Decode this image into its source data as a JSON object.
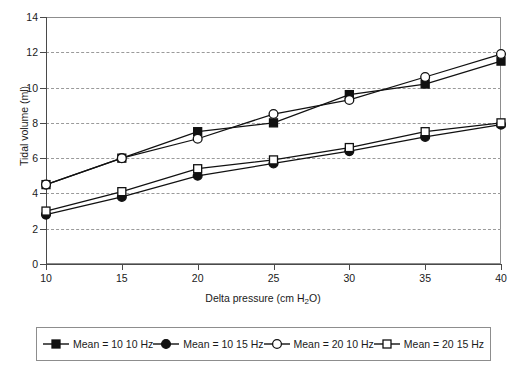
{
  "chart_data": {
    "type": "line",
    "title": "",
    "xlabel": "Delta pressure (cm H2O)",
    "ylabel": "Tidal volume (ml)",
    "x": [
      10,
      15,
      20,
      25,
      30,
      35,
      40
    ],
    "xlim": [
      10,
      40
    ],
    "ylim": [
      0,
      14
    ],
    "xticks": [
      10,
      15,
      20,
      25,
      30,
      35,
      40
    ],
    "yticks": [
      0,
      2,
      4,
      6,
      8,
      10,
      12,
      14
    ],
    "grid": "horizontal-dashed",
    "legend_position": "bottom",
    "series": [
      {
        "name": "Mean = 10 10 Hz",
        "marker": "filled-square",
        "values": [
          4.5,
          6.0,
          7.5,
          8.0,
          9.6,
          10.2,
          11.5
        ]
      },
      {
        "name": "Mean = 10 15 Hz",
        "marker": "filled-circle",
        "values": [
          2.8,
          3.8,
          5.0,
          5.7,
          6.4,
          7.2,
          7.9
        ]
      },
      {
        "name": "Mean = 20 10 Hz",
        "marker": "open-circle",
        "values": [
          4.5,
          6.0,
          7.1,
          8.5,
          9.3,
          10.6,
          11.9
        ]
      },
      {
        "name": "Mean = 20 15 Hz",
        "marker": "open-square",
        "values": [
          3.0,
          4.1,
          5.4,
          5.9,
          6.6,
          7.5,
          8.0
        ]
      }
    ]
  },
  "axis": {
    "x_title_main": "Delta pressure (cm H",
    "x_title_sub": "2",
    "x_title_tail": "O)",
    "y_title": "Tidal volume (ml)",
    "y_tick_labels": [
      "14",
      "12",
      "10",
      "8",
      "6",
      "4",
      "2",
      "0"
    ],
    "x_tick_labels": [
      "10",
      "15",
      "20",
      "25",
      "30",
      "35",
      "40"
    ]
  },
  "legend": {
    "items": [
      {
        "label": "Mean = 10 10 Hz",
        "marker": "filled-square"
      },
      {
        "label": "Mean = 10 15 Hz",
        "marker": "filled-circle"
      },
      {
        "label": "Mean = 20 10 Hz",
        "marker": "open-circle"
      },
      {
        "label": "Mean = 20 15 Hz",
        "marker": "open-square"
      }
    ]
  },
  "colors": {
    "line": "#111111",
    "marker_fill": "#111111",
    "marker_open": "#ffffff",
    "grid": "#9a9a9a",
    "frame": "#8d8d8d",
    "text": "#1a1a1a"
  }
}
